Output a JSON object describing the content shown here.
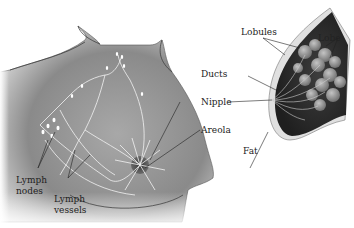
{
  "diagram": {
    "figures": [
      {
        "name": "front-view-torso",
        "description": "Torso with lymph nodes and lymph vessels"
      },
      {
        "name": "side-view-breast-cross-section",
        "description": "Cross-section showing lobules, lobe, ducts, fat"
      }
    ],
    "labels": {
      "lobules": "Lobules",
      "lobe": "Lobe",
      "ducts": "Ducts",
      "nipple": "Nipple",
      "areola": "Areola",
      "fat": "Fat",
      "lymph_nodes_1": "Lymph",
      "lymph_nodes_2": "nodes",
      "lymph_vessels_1": "Lymph",
      "lymph_vessels_2": "vessels"
    },
    "colors": {
      "skin_dark": "#6e6e6e",
      "skin_mid": "#9a9a9a",
      "skin_light": "#d6d6d6",
      "tissue_dark": "#3a3a3a",
      "lobule": "#8c8c8c",
      "line": "#1a1a1a",
      "vessel": "#f2f2f2"
    }
  }
}
